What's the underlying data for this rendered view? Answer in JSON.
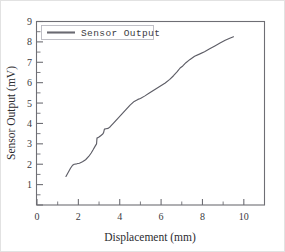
{
  "chart_data": {
    "type": "line",
    "title": "",
    "xlabel": "Displacement (mm)",
    "ylabel": "Sensor Output (mV)",
    "xlim": [
      0,
      11
    ],
    "ylim": [
      0,
      9
    ],
    "grid": false,
    "legend_position": "top-left",
    "x_ticks_major": [
      0,
      2,
      4,
      6,
      8,
      10
    ],
    "x_tick_labels": [
      "0",
      "2",
      "4",
      "6",
      "8",
      "10"
    ],
    "x_ticks_minor": [
      1,
      3,
      5,
      7,
      9,
      11
    ],
    "y_ticks_major": [
      0,
      1,
      2,
      3,
      4,
      5,
      6,
      7,
      8,
      9
    ],
    "y_tick_labels": [
      "",
      "1",
      "2",
      "3",
      "4",
      "5",
      "6",
      "7",
      "8",
      "9"
    ],
    "y_ticks_minor": [
      0.5,
      1.5,
      2.5,
      3.5,
      4.5,
      5.5,
      6.5,
      7.5,
      8.5
    ],
    "series": [
      {
        "name": "Sensor Output",
        "color": "#5d5d66",
        "x": [
          1.4,
          1.52,
          1.62,
          1.72,
          1.8,
          1.92,
          2.05,
          2.2,
          2.35,
          2.5,
          2.62,
          2.72,
          2.82,
          2.88,
          2.9,
          2.98,
          3.08,
          3.18,
          3.22,
          3.26,
          3.34,
          3.44,
          3.54,
          3.7,
          3.9,
          4.1,
          4.3,
          4.5,
          4.7,
          4.88,
          5.0,
          5.2,
          5.45,
          5.7,
          5.95,
          6.2,
          6.42,
          6.6,
          6.78,
          6.92,
          7.05,
          7.2,
          7.4,
          7.62,
          7.85,
          8.1,
          8.35,
          8.6,
          8.85,
          9.1,
          9.32,
          9.5
        ],
        "y": [
          1.4,
          1.62,
          1.8,
          1.95,
          2.0,
          2.02,
          2.05,
          2.12,
          2.22,
          2.38,
          2.55,
          2.72,
          2.9,
          3.0,
          3.28,
          3.32,
          3.4,
          3.48,
          3.55,
          3.72,
          3.74,
          3.76,
          3.84,
          4.02,
          4.24,
          4.46,
          4.68,
          4.9,
          5.08,
          5.18,
          5.22,
          5.34,
          5.5,
          5.66,
          5.82,
          5.98,
          6.16,
          6.34,
          6.54,
          6.72,
          6.82,
          6.98,
          7.14,
          7.3,
          7.4,
          7.52,
          7.66,
          7.8,
          7.94,
          8.08,
          8.18,
          8.25
        ]
      }
    ],
    "legend": [
      {
        "label": "Sensor Output",
        "color": "#5d5d66"
      }
    ]
  },
  "axes": {
    "x_title": "Displacement (mm)",
    "y_title": "Sensor Output (mV)"
  },
  "legend": {
    "entry_label": "Sensor Output"
  },
  "colors": {
    "line": "#5d5d66",
    "axis": "#6e6e74",
    "text": "#2c2c30",
    "legend_border": "#b9b9c0",
    "page_border": "#e2e2e2",
    "background": "#ffffff"
  }
}
